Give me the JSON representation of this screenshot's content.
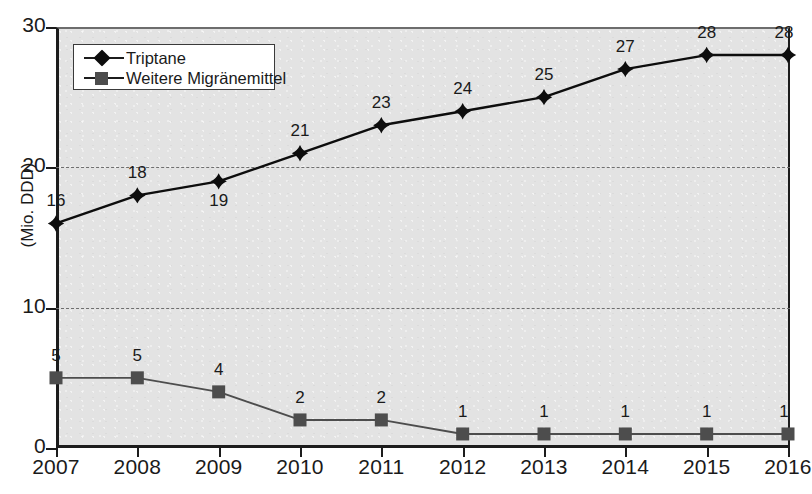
{
  "chart_data": {
    "type": "line",
    "title": "",
    "xlabel": "",
    "ylabel": "(Mio. DDD)",
    "categories": [
      "2007",
      "2008",
      "2009",
      "2010",
      "2011",
      "2012",
      "2013",
      "2014",
      "2015",
      "2016"
    ],
    "ylim": [
      0,
      30
    ],
    "yticks": [
      0,
      10,
      20,
      30
    ],
    "ytick_labels": [
      "0",
      "10",
      "20",
      "30"
    ],
    "gridlines": [
      10,
      20
    ],
    "grid": "horizontal-dashed",
    "legend_position": "top-left-inside",
    "series": [
      {
        "name": "Triptane",
        "marker": "diamond",
        "color": "#0d0d0d",
        "values": [
          16,
          18,
          19,
          21,
          23,
          24,
          25,
          27,
          28,
          28
        ],
        "labels": [
          "16",
          "18",
          "19",
          "21",
          "23",
          "24",
          "25",
          "27",
          "28",
          "28"
        ]
      },
      {
        "name": "Weitere Migränemittel",
        "marker": "square",
        "color": "#4d4d4d",
        "values": [
          5,
          5,
          4,
          2,
          2,
          1,
          1,
          1,
          1,
          1
        ],
        "labels": [
          "5",
          "5",
          "4",
          "2",
          "2",
          "1",
          "1",
          "1",
          "1",
          "1"
        ]
      }
    ]
  },
  "legend": {
    "items": [
      {
        "label": "Triptane",
        "marker": "diamond-marker-icon"
      },
      {
        "label": "Weitere Migränemittel",
        "marker": "square-marker-icon"
      }
    ]
  },
  "colors": {
    "plot_background": "#e3e3e3",
    "axis": "#1c1c1c",
    "gridline": "#6f6f6f",
    "series_triptane": "#0d0d0d",
    "series_weitere": "#4d4d4d",
    "page_background": "#ffffff"
  }
}
